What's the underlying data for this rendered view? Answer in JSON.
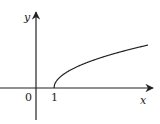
{
  "diagram": {
    "type": "function-graph",
    "axes": {
      "x_label": "x",
      "y_label": "y",
      "origin_label": "0",
      "x_tick_label": "1"
    },
    "curve": {
      "function": "sqrt(x-1)",
      "start_x": 1,
      "color": "#222222"
    },
    "colors": {
      "axis": "#222222",
      "background": "#ffffff"
    }
  }
}
